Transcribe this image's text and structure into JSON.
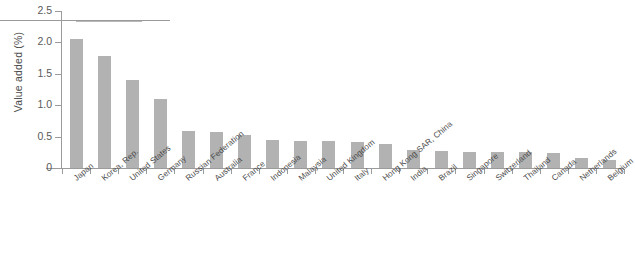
{
  "chart_data": {
    "type": "bar",
    "title": "",
    "xlabel": "",
    "ylabel": "Value added (%)",
    "ylim": [
      0,
      2.5
    ],
    "ytick_labels": [
      "0",
      "0.5",
      "1.0",
      "1.5",
      "2.0",
      "2.5"
    ],
    "ytick_values": [
      0,
      0.5,
      1.0,
      1.5,
      2.0,
      2.5
    ],
    "grid": false,
    "legend": "none",
    "bar_color": "#b2b2b2",
    "axis_color": "#9b9b9b",
    "categories": [
      "Japan",
      "Korea, Rep.",
      "United States",
      "Germany",
      "Russian Federation",
      "Australia",
      "France",
      "Indonesia",
      "Malaysia",
      "United Kingdom",
      "Italy",
      "Hong Kong SAR, China",
      "India",
      "Brazil",
      "Singapore",
      "Switzerland",
      "Thailand",
      "Canada",
      "Netherlands",
      "Belgium"
    ],
    "values": [
      2.05,
      1.79,
      1.4,
      1.1,
      0.59,
      0.57,
      0.52,
      0.44,
      0.43,
      0.43,
      0.41,
      0.38,
      0.29,
      0.27,
      0.26,
      0.25,
      0.25,
      0.24,
      0.16,
      0.12
    ]
  },
  "axis": {
    "y_title": "Value added (%)"
  }
}
